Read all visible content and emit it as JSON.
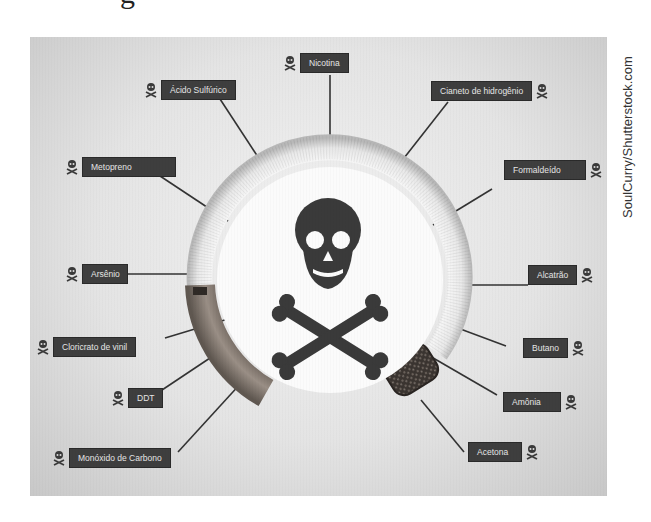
{
  "header": {
    "title_fragment": "g"
  },
  "diagram": {
    "center_icon": "skull-crossbones-icon",
    "colors": {
      "label_bg": "#3e3e3e",
      "label_text": "#e6e6e6",
      "ring": "#efefef",
      "filter": "#8a7d72",
      "ember": "#3b3530"
    },
    "labels": [
      {
        "id": "nicotina",
        "text": "Nicotina"
      },
      {
        "id": "acido-sulfurico",
        "text": "Ácido Sulfúrico"
      },
      {
        "id": "cianeto-de-hidrogenio",
        "text": "Cianeto de hidrogênio"
      },
      {
        "id": "metopreno",
        "text": "Metopreno"
      },
      {
        "id": "formaldeido",
        "text": "Formaldeído"
      },
      {
        "id": "arsenio",
        "text": "Arsênio"
      },
      {
        "id": "alcatrao",
        "text": "Alcatrão"
      },
      {
        "id": "cloricrato-de-vinil",
        "text": "Cloricrato de vinil"
      },
      {
        "id": "butano",
        "text": "Butano"
      },
      {
        "id": "ddt",
        "text": "DDT"
      },
      {
        "id": "amonia",
        "text": "Amônia"
      },
      {
        "id": "monoxido-de-carbono",
        "text": "Monóxido de Carbono"
      },
      {
        "id": "acetona",
        "text": "Acetona"
      }
    ]
  },
  "watermark": "SoulCurry/Shutterstock.com"
}
